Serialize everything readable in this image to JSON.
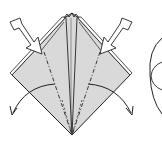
{
  "figure": {
    "type": "origami-diagram",
    "colors": {
      "paper": "#d9d9d9",
      "line": "#222222",
      "background": "#ffffff",
      "arrow_fill": "#ffffff"
    },
    "elements": {
      "paper_shape": "diamond",
      "push_arrows": [
        "left-push-arrow",
        "right-push-arrow"
      ],
      "fold_arrows": [
        "left-curved-arrow",
        "right-curved-arrow"
      ],
      "crease_lines": [
        "left-dash-dot-crease",
        "right-dash-dot-crease",
        "center-valley-lines"
      ],
      "next_step_partial": "circle-outline"
    }
  }
}
